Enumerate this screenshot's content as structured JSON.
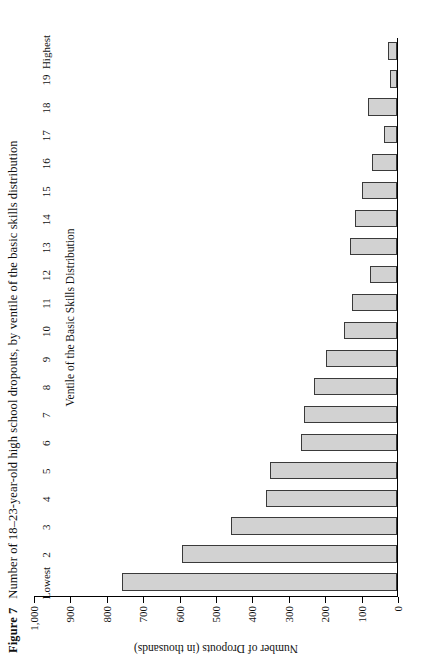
{
  "figure": {
    "number": "Figure 7",
    "caption": "Number of 18–23-year-old high school dropouts, by ventile of the basic skills distribution"
  },
  "chart_data": {
    "type": "bar",
    "orientation": "vertical",
    "title": "Number of 18–23-year-old high school dropouts, by ventile of the basic skills distribution",
    "xlabel": "Ventile of the Basic Skills Distribution",
    "ylabel": "Number of Dropouts (in thousands)",
    "categories": [
      "Lowest",
      "2",
      "3",
      "4",
      "5",
      "6",
      "7",
      "8",
      "9",
      "10",
      "11",
      "12",
      "13",
      "14",
      "15",
      "16",
      "17",
      "18",
      "19",
      "Highest"
    ],
    "values": [
      755,
      590,
      455,
      360,
      350,
      265,
      255,
      228,
      195,
      145,
      125,
      75,
      130,
      115,
      95,
      70,
      35,
      80,
      20,
      25
    ],
    "ylim": [
      0,
      1000
    ],
    "yticks": [
      "0",
      "100",
      "200",
      "300",
      "400",
      "500",
      "600",
      "700",
      "800",
      "900",
      "1,000"
    ],
    "ytick_values": [
      0,
      100,
      200,
      300,
      400,
      500,
      600,
      700,
      800,
      900,
      1000
    ],
    "grid": false,
    "legend": false,
    "bar_fill": "#d2d2d2",
    "bar_edge": "#3a3a3a"
  }
}
